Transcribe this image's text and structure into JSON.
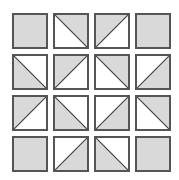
{
  "diagram": {
    "title": "",
    "type": "quilt-grid",
    "rows": 4,
    "cols": 4,
    "colors": {
      "fill": "#d9d9d9",
      "empty": "#ffffff",
      "stroke": "#555555"
    },
    "layout": {
      "x": [
        12,
        53,
        94,
        135
      ],
      "y": [
        13,
        54,
        95,
        136
      ],
      "size": 36
    },
    "legend": "shape: full = solid gray square; tl-br = diagonal from top-left to bottom-right; bl-tr = diagonal from bottom-left to top-right; fill = which triangle is gray",
    "cells": [
      [
        {
          "shape": "full"
        },
        {
          "shape": "tl-br",
          "fill": "upper-right"
        },
        {
          "shape": "bl-tr",
          "fill": "upper-left"
        },
        {
          "shape": "full"
        }
      ],
      [
        {
          "shape": "tl-br",
          "fill": "lower-left"
        },
        {
          "shape": "bl-tr",
          "fill": "upper-left"
        },
        {
          "shape": "tl-br",
          "fill": "upper-right"
        },
        {
          "shape": "bl-tr",
          "fill": "lower-right"
        }
      ],
      [
        {
          "shape": "bl-tr",
          "fill": "upper-left"
        },
        {
          "shape": "tl-br",
          "fill": "lower-left"
        },
        {
          "shape": "bl-tr",
          "fill": "lower-right"
        },
        {
          "shape": "tl-br",
          "fill": "upper-right"
        }
      ],
      [
        {
          "shape": "full"
        },
        {
          "shape": "bl-tr",
          "fill": "lower-right"
        },
        {
          "shape": "tl-br",
          "fill": "lower-left"
        },
        {
          "shape": "full"
        }
      ]
    ]
  }
}
